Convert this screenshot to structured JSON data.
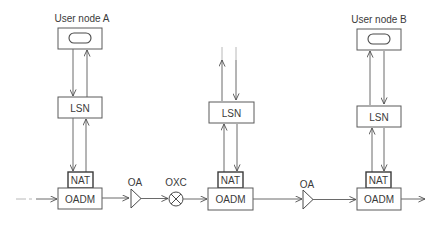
{
  "diagram": {
    "nodes": {
      "user_a": {
        "label": "User node A",
        "icon": "terminal-pill-icon"
      },
      "user_b": {
        "label": "User node B",
        "icon": "terminal-pill-icon"
      },
      "lsn_a": {
        "label": "LSN"
      },
      "lsn_mid": {
        "label": "LSN"
      },
      "lsn_b": {
        "label": "LSN"
      },
      "nat_a": {
        "label": "NAT"
      },
      "nat_mid": {
        "label": "NAT"
      },
      "nat_b": {
        "label": "NAT"
      },
      "oadm_a": {
        "label": "OADM"
      },
      "oadm_mid": {
        "label": "OADM"
      },
      "oadm_b": {
        "label": "OADM"
      },
      "oa_1": {
        "label": "OA",
        "icon": "amplifier-triangle-icon"
      },
      "oxc": {
        "label": "OXC",
        "icon": "cross-connect-circle-icon"
      },
      "oa_2": {
        "label": "OA",
        "icon": "amplifier-triangle-icon"
      }
    },
    "edges": [
      {
        "from": "input",
        "to": "OADM (A)",
        "style": "dashed-then-solid"
      },
      {
        "from": "OADM (A)",
        "to": "OA"
      },
      {
        "from": "OA",
        "to": "OXC"
      },
      {
        "from": "OXC",
        "to": "OADM (middle)"
      },
      {
        "from": "OADM (middle)",
        "to": "OA"
      },
      {
        "from": "OA",
        "to": "OADM (B)"
      },
      {
        "from": "OADM (B)",
        "to": "output"
      },
      {
        "from": "User node A",
        "to": "LSN",
        "bidirectional": true
      },
      {
        "from": "LSN",
        "to": "NAT",
        "bidirectional": true
      },
      {
        "from": "LSN (middle)",
        "to": "upstream",
        "bidirectional": true,
        "style": "faded"
      },
      {
        "from": "User node B",
        "to": "LSN",
        "bidirectional": true
      }
    ]
  }
}
